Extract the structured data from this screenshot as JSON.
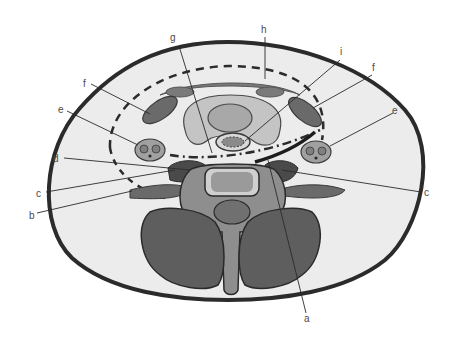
{
  "figure": {
    "type": "anatomical cross-section",
    "labels": [
      {
        "id": "a",
        "text": "a"
      },
      {
        "id": "b",
        "text": "b"
      },
      {
        "id": "c_left",
        "text": "c"
      },
      {
        "id": "c_right",
        "text": "c"
      },
      {
        "id": "d",
        "text": "d"
      },
      {
        "id": "e_left",
        "text": "e"
      },
      {
        "id": "e_right",
        "text": "e"
      },
      {
        "id": "f_left",
        "text": "f"
      },
      {
        "id": "f_right",
        "text": "f"
      },
      {
        "id": "g",
        "text": "g"
      },
      {
        "id": "h",
        "text": "h"
      },
      {
        "id": "i",
        "text": "i"
      }
    ]
  },
  "colors": {
    "background": "#ffffff",
    "outline": "#2b2b2b",
    "skin_fill": "#ececec",
    "muscle_dark": "#5e5e5e",
    "muscle_mid": "#7a7a7a",
    "organ_light": "#c4c4c4",
    "organ_mid": "#a8a8a8",
    "bone_light": "#cfcfcf",
    "bone_body": "#8e8e8e",
    "label_text": "#4a4a4a"
  }
}
